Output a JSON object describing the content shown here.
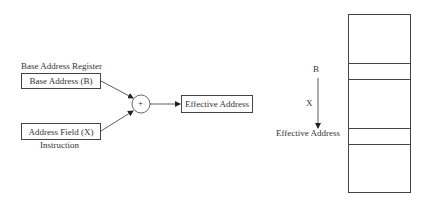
{
  "left_diagram": {
    "register_caption": "Base Address Register",
    "base_box_label": "Base Address (B)",
    "field_box_label": "Address Field (X)",
    "instruction_caption": "Instruction",
    "adder_symbol": "+",
    "result_box_label": "Effective Address"
  },
  "right_diagram": {
    "base_label": "B",
    "offset_label": "X",
    "result_label": "Effective Address",
    "memory_segments": 5
  }
}
